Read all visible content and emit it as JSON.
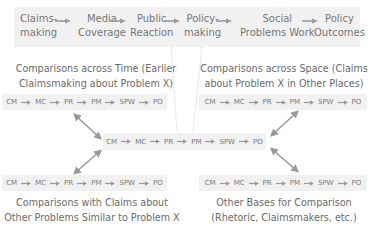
{
  "top_process": {
    "stages": [
      {
        "line1": "Claims-",
        "line2": "making"
      },
      {
        "line1": "Media",
        "line2": "Coverage"
      },
      {
        "line1": "Public",
        "line2": "Reaction"
      },
      {
        "line1": "Policy-",
        "line2": "making"
      },
      {
        "line1": "Social",
        "line2": "Problems Work"
      },
      {
        "line1": "Policy",
        "line2": "Outcomes"
      }
    ]
  },
  "abbrev_chain": [
    "CM",
    "MC",
    "PR",
    "PM",
    "SPW",
    "PO"
  ],
  "comparisons": {
    "top_left": {
      "line1": "Comparisons across Time (Earlier",
      "line2": "Claimsmaking about Problem X)"
    },
    "top_right": {
      "line1": "Comparisons across Space (Claims",
      "line2": "about Problem X in Other Places)"
    },
    "bottom_left": {
      "line1": "Comparisons with Claims about",
      "line2": "Other Problems Similar to Problem X"
    },
    "bottom_right": {
      "line1": "Other Bases for Comparison",
      "line2": "(Rhetoric, Claimsmakers, etc.)"
    }
  },
  "colors": {
    "box_fill": "#f1f1f1",
    "arrow": "#9a9a9a",
    "text": "#6e6e6e"
  }
}
